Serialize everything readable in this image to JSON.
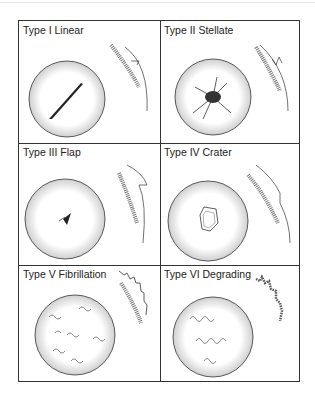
{
  "figure": {
    "panels": [
      {
        "label": "Type I  Linear",
        "lesion": "linear"
      },
      {
        "label": "Type II Stellate",
        "lesion": "stellate"
      },
      {
        "label": "Type III  Flap",
        "lesion": "flap"
      },
      {
        "label": "Type IV Crater",
        "lesion": "crater"
      },
      {
        "label": "Type V Fibrillation",
        "lesion": "fibrillation"
      },
      {
        "label": "Type VI  Degrading",
        "lesion": "degrading"
      }
    ]
  }
}
